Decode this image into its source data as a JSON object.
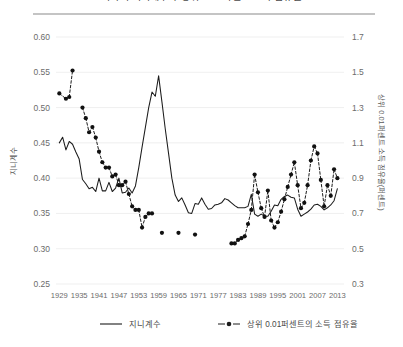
{
  "title": "미국의 지니계수와 상위 0.01퍼센트 소득 점유율",
  "legend": {
    "items": [
      {
        "label": "지니계수",
        "style": "solid-line",
        "color": "#1c1c1c"
      },
      {
        "label": "상위 0.01퍼센트의 소득 점유율",
        "style": "dashed-line-markers",
        "color": "#1c1c1c"
      }
    ]
  },
  "colors": {
    "line": "#1c1c1c",
    "grid": "#e8e8e8",
    "text": "#6b6b6b",
    "rule": "#8a8a8a",
    "background": "#ffffff"
  },
  "chart_data": {
    "type": "line",
    "title": "미국의 지니계수와 상위 0.01퍼센트 소득 점유율",
    "xlabel": "",
    "ylabel": "지니계수",
    "y2label": "상위 0.01퍼센트 소득 점유율(퍼센트)",
    "grid": true,
    "legend_position": "bottom",
    "xlim": [
      1928,
      2015
    ],
    "xticks": [
      1929,
      1935,
      1941,
      1947,
      1953,
      1959,
      1965,
      1971,
      1977,
      1983,
      1989,
      1995,
      2001,
      2007,
      2013
    ],
    "ylim": [
      0.25,
      0.6
    ],
    "yticks": [
      0.25,
      0.3,
      0.35,
      0.4,
      0.45,
      0.5,
      0.55,
      0.6
    ],
    "y2lim": [
      0.3,
      1.7
    ],
    "y2ticks": [
      0.3,
      0.5,
      0.7,
      0.9,
      1.1,
      1.3,
      1.5,
      1.7
    ],
    "series": [
      {
        "name": "지니계수",
        "axis": "left",
        "style": "solid",
        "markers": false,
        "x": [
          1929,
          1930,
          1931,
          1932,
          1933,
          1934,
          1935,
          1936,
          1937,
          1938,
          1939,
          1940,
          1941,
          1942,
          1943,
          1944,
          1945,
          1946,
          1947,
          1948,
          1949,
          1950,
          1951,
          1952,
          1953,
          1954,
          1955,
          1956,
          1957,
          1958,
          1959,
          1960,
          1961,
          1962,
          1963,
          1964,
          1965,
          1966,
          1967,
          1968,
          1969,
          1970,
          1971,
          1972,
          1973,
          1974,
          1975,
          1976,
          1977,
          1978,
          1979,
          1980,
          1981,
          1982,
          1983,
          1984,
          1985,
          1986,
          1987,
          1988,
          1989,
          1990,
          1991,
          1992,
          1993,
          1994,
          1995,
          1996,
          1997,
          1998,
          1999,
          2000,
          2001,
          2002,
          2003,
          2004,
          2005,
          2006,
          2007,
          2008,
          2009,
          2010,
          2011,
          2012,
          2013
        ],
        "values": [
          0.45,
          0.458,
          0.44,
          0.452,
          0.448,
          0.437,
          0.427,
          0.398,
          0.392,
          0.385,
          0.387,
          0.381,
          0.4,
          0.382,
          0.382,
          0.394,
          0.381,
          0.386,
          0.4,
          0.379,
          0.38,
          0.386,
          0.379,
          0.389,
          0.415,
          0.444,
          0.472,
          0.5,
          0.522,
          0.516,
          0.545,
          0.508,
          0.47,
          0.435,
          0.4,
          0.376,
          0.367,
          0.372,
          0.362,
          0.351,
          0.35,
          0.364,
          0.363,
          0.372,
          0.363,
          0.356,
          0.357,
          0.362,
          0.363,
          0.365,
          0.371,
          0.369,
          0.365,
          0.361,
          0.358,
          0.358,
          0.358,
          0.36,
          0.377,
          0.349,
          0.346,
          0.349,
          0.346,
          0.346,
          0.353,
          0.362,
          0.361,
          0.37,
          0.374,
          0.376,
          0.373,
          0.372,
          0.356,
          0.346,
          0.349,
          0.352,
          0.356,
          0.362,
          0.363,
          0.36,
          0.355,
          0.358,
          0.362,
          0.368,
          0.385
        ]
      },
      {
        "name": "상위 0.01퍼센트의 소득 점유율",
        "axis": "right",
        "style": "dashed",
        "markers": true,
        "x": [
          1929,
          1931,
          1932,
          1933,
          1936,
          1937,
          1938,
          1939,
          1940,
          1941,
          1942,
          1943,
          1944,
          1945,
          1946,
          1947,
          1948,
          1949,
          1950,
          1951,
          1952,
          1953,
          1954,
          1955,
          1956,
          1957,
          1960,
          1965,
          1970,
          1981,
          1982,
          1983,
          1984,
          1985,
          1986,
          1987,
          1988,
          1989,
          1990,
          1991,
          1992,
          1993,
          1994,
          1995,
          1996,
          1997,
          1998,
          1999,
          2000,
          2001,
          2002,
          2003,
          2004,
          2005,
          2006,
          2007,
          2008,
          2009,
          2010,
          2011,
          2012,
          2013
        ],
        "values": [
          1.38,
          1.35,
          1.36,
          1.51,
          1.3,
          1.24,
          1.16,
          1.19,
          1.13,
          1.05,
          0.99,
          0.96,
          0.96,
          0.91,
          0.92,
          0.86,
          0.86,
          0.88,
          0.81,
          0.74,
          0.72,
          0.72,
          0.62,
          0.68,
          0.7,
          0.7,
          0.59,
          0.59,
          0.58,
          0.53,
          0.53,
          0.55,
          0.56,
          0.57,
          0.64,
          0.72,
          0.92,
          0.82,
          0.73,
          0.68,
          0.83,
          0.66,
          0.62,
          0.65,
          0.71,
          0.78,
          0.85,
          0.92,
          0.99,
          0.86,
          0.73,
          0.76,
          0.86,
          1.0,
          1.08,
          1.04,
          0.89,
          0.74,
          0.86,
          0.8,
          0.95,
          0.9
        ]
      }
    ]
  }
}
